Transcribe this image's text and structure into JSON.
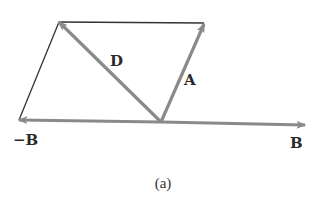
{
  "figure": {
    "caption": "(a)",
    "colors": {
      "vector": "#8a8a8a",
      "outline": "#333333",
      "text": "#2a2a2a"
    },
    "origin": [
      161,
      122
    ],
    "vectors": [
      {
        "id": "A",
        "label": "A",
        "from": [
          161,
          122
        ],
        "to": [
          204,
          24
        ],
        "label_pos": [
          186,
          84
        ]
      },
      {
        "id": "B",
        "label": "B",
        "from": [
          161,
          122
        ],
        "to": [
          305,
          125
        ],
        "label_pos": [
          291,
          147
        ]
      },
      {
        "id": "negB",
        "label": "−B",
        "from": [
          161,
          122
        ],
        "to": [
          19,
          120
        ],
        "label_pos": [
          14,
          144
        ]
      },
      {
        "id": "D",
        "label": "D",
        "from": [
          161,
          122
        ],
        "to": [
          59,
          22
        ],
        "label_pos": [
          110,
          66
        ]
      }
    ],
    "parallelogram_edges": [
      {
        "from": [
          59,
          22
        ],
        "to": [
          204,
          23
        ]
      },
      {
        "from": [
          19,
          120
        ],
        "to": [
          59,
          22
        ]
      }
    ]
  }
}
